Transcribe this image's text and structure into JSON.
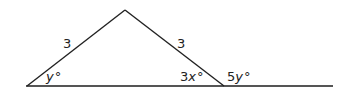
{
  "diagram": {
    "type": "geometry-triangle",
    "sides": {
      "left": "3",
      "right": "3"
    },
    "angles": {
      "left_base": {
        "coef": "",
        "var": "y",
        "unit": "°"
      },
      "right_base_interior": {
        "coef": "3",
        "var": "x",
        "unit": "°"
      },
      "exterior": {
        "coef": "5",
        "var": "y",
        "unit": "°"
      }
    },
    "colors": {
      "line": "#222222",
      "baseline": "#555555",
      "text": "#222222"
    }
  }
}
